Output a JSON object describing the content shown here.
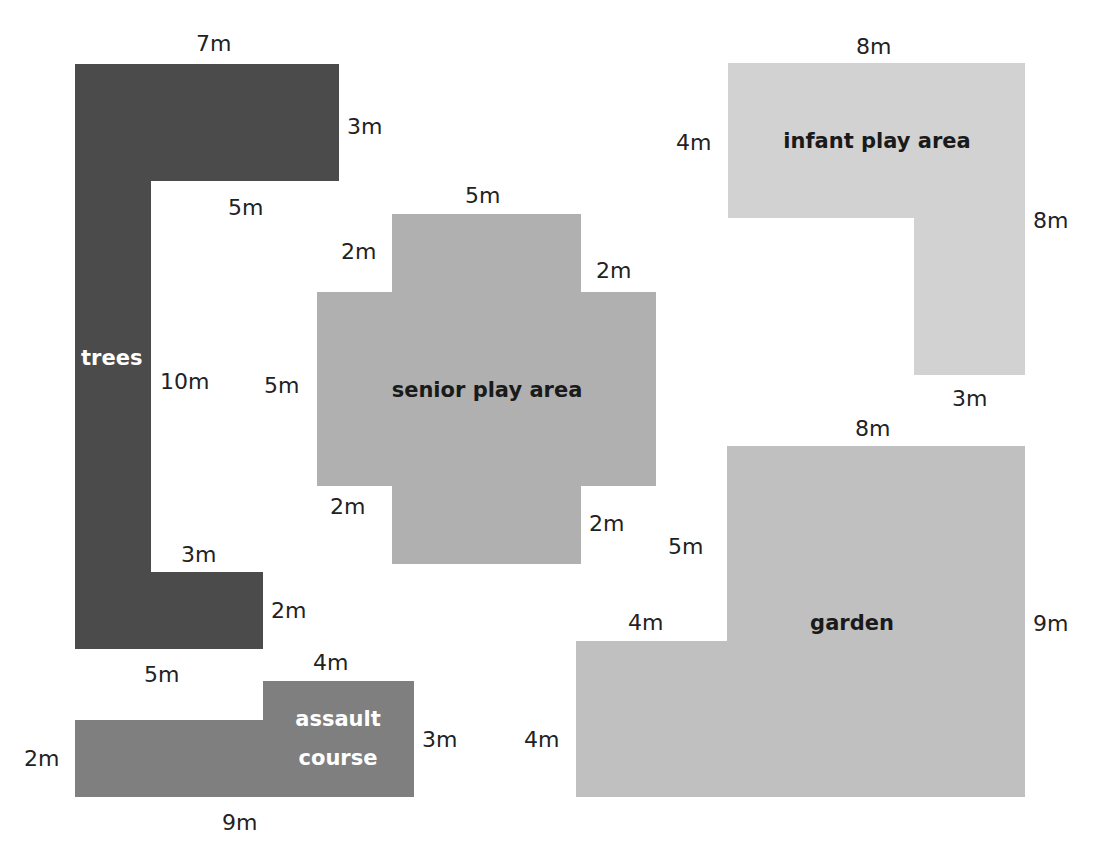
{
  "diagram": {
    "type": "compound-shape plan",
    "unit": "m",
    "colors": {
      "trees": "#4b4b4b",
      "assault_course": "#7f7f7f",
      "senior_play_area": "#b0b0b0",
      "infant_play_area": "#d2d2d2",
      "garden": "#c0c0c0",
      "label_dark": "#1a1a1a",
      "label_light": "#ffffff"
    },
    "shapes": [
      {
        "id": "trees",
        "label": "trees",
        "dimensions": [
          "7m",
          "3m",
          "5m",
          "10m",
          "3m",
          "2m",
          "5m"
        ]
      },
      {
        "id": "senior",
        "label": "senior play area",
        "dimensions": [
          "5m",
          "2m",
          "2m",
          "5m",
          "2m",
          "2m"
        ]
      },
      {
        "id": "infant",
        "label": "infant play area",
        "dimensions": [
          "8m",
          "4m",
          "8m",
          "3m"
        ]
      },
      {
        "id": "garden",
        "label": "garden",
        "dimensions": [
          "8m",
          "5m",
          "4m",
          "9m",
          "4m"
        ]
      },
      {
        "id": "assault",
        "label_line1": "assault",
        "label_line2": "course",
        "dimensions": [
          "4m",
          "5m",
          "3m",
          "2m",
          "9m"
        ]
      }
    ]
  }
}
